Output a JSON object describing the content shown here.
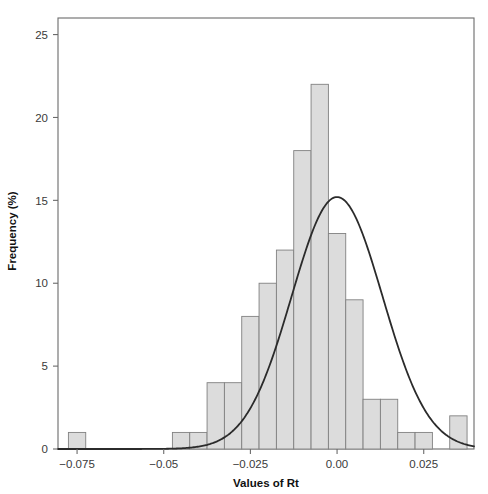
{
  "chart_data": {
    "type": "bar",
    "title": "",
    "subtitle": "",
    "xlabel": "Values of Rt",
    "ylabel": "Frequency (%)",
    "xlim": [
      -0.0805,
      0.0395
    ],
    "ylim": [
      0,
      26
    ],
    "grid": false,
    "legend": null,
    "bin_width": 0.005,
    "bin_left_edges": [
      -0.0775,
      -0.0725,
      -0.0675,
      -0.0625,
      -0.0575,
      -0.0525,
      -0.0475,
      -0.0425,
      -0.0375,
      -0.0325,
      -0.0275,
      -0.0225,
      -0.0175,
      -0.0125,
      -0.0075,
      -0.0025,
      0.0025,
      0.0075,
      0.0125,
      0.0175,
      0.0225,
      0.0275,
      0.0325
    ],
    "categories": [
      "-0.0775",
      "-0.0725",
      "-0.0675",
      "-0.0625",
      "-0.0575",
      "-0.0525",
      "-0.0475",
      "-0.0425",
      "-0.0375",
      "-0.0325",
      "-0.0275",
      "-0.0225",
      "-0.0175",
      "-0.0125",
      "-0.0075",
      "-0.0025",
      "0.0025",
      "0.0075",
      "0.0125",
      "0.0175",
      "0.0225",
      "0.0275",
      "0.0325"
    ],
    "values": [
      1,
      0,
      0,
      0,
      0,
      0,
      1,
      1,
      4,
      4,
      8,
      10,
      12,
      18,
      22,
      13,
      9,
      3,
      3,
      1,
      1,
      0,
      2
    ],
    "overlay_curve": {
      "name": "normal-density-fit",
      "type": "line",
      "mean": 0.0,
      "peak_value": 15.2,
      "sigma": 0.0131,
      "color": "#2b2b2b"
    },
    "xticks": [
      {
        "value": -0.075,
        "label": "-0.075"
      },
      {
        "value": -0.05,
        "label": "-0.05"
      },
      {
        "value": -0.025,
        "label": "-0.025"
      },
      {
        "value": 0.0,
        "label": "0.00"
      },
      {
        "value": 0.025,
        "label": "0.025"
      }
    ],
    "yticks": [
      {
        "value": 0,
        "label": "0"
      },
      {
        "value": 5,
        "label": "5"
      },
      {
        "value": 10,
        "label": "10"
      },
      {
        "value": 15,
        "label": "15"
      },
      {
        "value": 20,
        "label": "20"
      },
      {
        "value": 25,
        "label": "25"
      }
    ],
    "colors": {
      "bar_fill": "#dcdcdc",
      "bar_stroke": "#808080",
      "curve": "#2b2b2b",
      "axis": "#6b6b6b",
      "text": "#222222",
      "background": "#ffffff"
    }
  }
}
